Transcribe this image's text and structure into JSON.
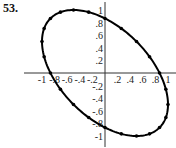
{
  "problem_label": "53.",
  "chart_data": {
    "type": "line",
    "title": "",
    "xlabel": "",
    "ylabel": "",
    "xlim": [
      -1,
      1
    ],
    "ylim": [
      -1,
      1
    ],
    "grid": false,
    "x_ticks": [
      "-1",
      "-.8",
      "-.6",
      "-.4",
      "-.2",
      ".2",
      ".4",
      ".6",
      ".8",
      "1"
    ],
    "y_ticks": [
      "1",
      ".8",
      ".6",
      ".4",
      ".2",
      "-.2",
      "-.4",
      "-.6",
      "-.8",
      "-1"
    ],
    "series": [
      {
        "name": "parametric ellipse x=cos t, y=cos(t+2π/3)",
        "points": [
          [
            1,
            -0.5
          ],
          [
            0.866,
            -0.866
          ],
          [
            0.5,
            -1
          ],
          [
            0,
            -0.866
          ],
          [
            -0.5,
            -0.5
          ],
          [
            -0.866,
            0
          ],
          [
            -1,
            0.5
          ],
          [
            -0.866,
            0.866
          ],
          [
            -0.5,
            1
          ],
          [
            0,
            0.866
          ],
          [
            0.5,
            0.5
          ],
          [
            0.866,
            0
          ]
        ]
      }
    ]
  }
}
